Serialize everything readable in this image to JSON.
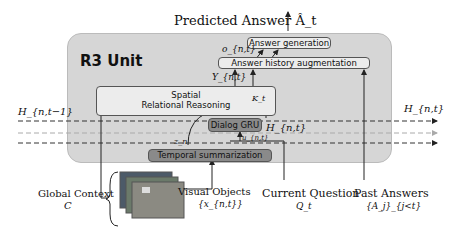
{
  "top_label": "Predicted Answer Â_t",
  "unit_title": "R3 Unit",
  "blocks": {
    "answer_generation": "Answer generation",
    "answer_history": "Answer history augmentation",
    "spatial_line1": "Spatial",
    "spatial_line2": "Relational Reasoning",
    "dialog_gru": "Dialog GRU",
    "temporal": "Temporal summarization"
  },
  "symbols": {
    "o": "o_{n,t}",
    "y": "Y_{n,t}",
    "k": "K_t",
    "z": "z_n",
    "u": "u_{n,t}",
    "h_out_inner": "H_{n,t}",
    "h_in": "H_{n,t−1}",
    "h_out": "H_{n,t}"
  },
  "inputs": {
    "global_context": "Global Context",
    "global_context_symbol": "C",
    "visual_objects": "Visual Objects",
    "visual_objects_symbol": "{x_{n,t}}",
    "current_question": "Current Question",
    "current_question_symbol": "Q_t",
    "past_answers": "Past Answers",
    "past_answers_symbol": "{A_j}_{j<t}"
  }
}
